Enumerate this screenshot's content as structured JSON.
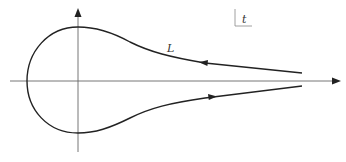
{
  "diagram": {
    "type": "contour",
    "contour_label": "L",
    "plane_label": "t",
    "colors": {
      "axis": "#555555",
      "curve": "#222222",
      "background": "#ffffff"
    },
    "arrows": [
      {
        "position": "upper branch",
        "direction": "left"
      },
      {
        "position": "lower branch",
        "direction": "right"
      }
    ]
  }
}
